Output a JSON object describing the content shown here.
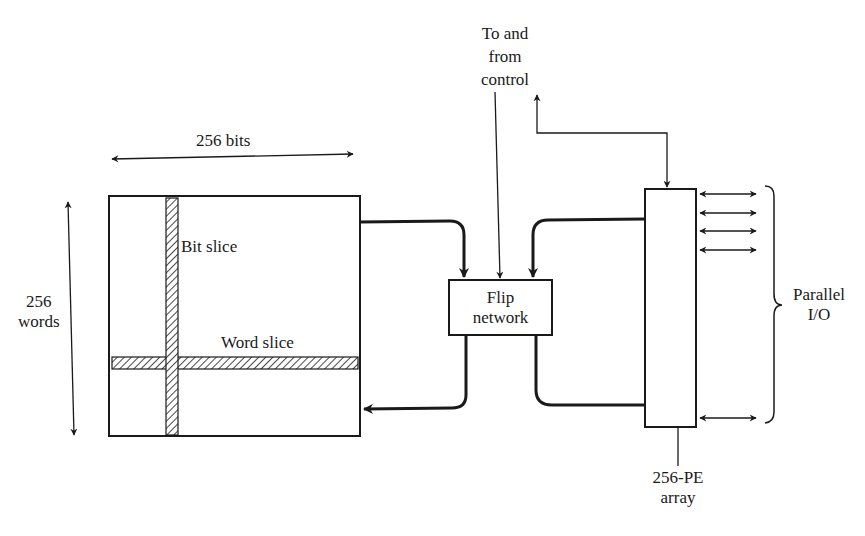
{
  "diagram": {
    "type": "block-diagram",
    "nodes": {
      "memory_array": {
        "width_label": "256 bits",
        "height_label_line1": "256",
        "height_label_line2": "words",
        "bit_slice_label": "Bit slice",
        "word_slice_label": "Word slice"
      },
      "flip_network": {
        "line1": "Flip",
        "line2": "network"
      },
      "pe_array": {
        "line1": "256-PE",
        "line2": "array"
      },
      "control": {
        "line1": "To and",
        "line2": "from",
        "line3": "control"
      },
      "parallel_io": {
        "line1": "Parallel",
        "line2": "I/O"
      }
    },
    "edges": [
      {
        "from": "memory_array",
        "to": "flip_network"
      },
      {
        "from": "flip_network",
        "to": "memory_array"
      },
      {
        "from": "pe_array",
        "to": "flip_network"
      },
      {
        "from": "flip_network",
        "to": "pe_array"
      },
      {
        "from": "control",
        "to": "flip_network"
      },
      {
        "from": "pe_array",
        "to": "control",
        "bidirectional": true
      },
      {
        "from": "pe_array",
        "to": "parallel_io",
        "bidirectional": true,
        "count_shown": 5
      }
    ],
    "colors": {
      "line": "#1a1a1a",
      "background": "#ffffff"
    }
  }
}
